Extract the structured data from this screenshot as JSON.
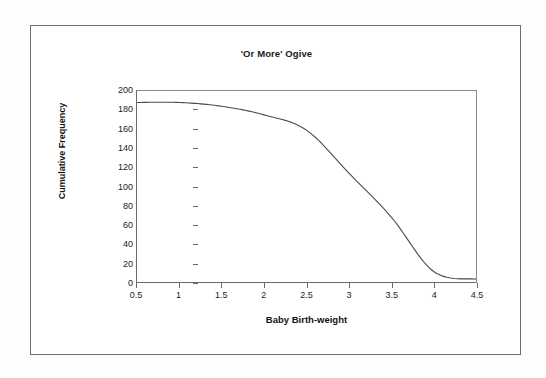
{
  "figure": {
    "title": "'Or More' Ogive"
  },
  "chart_data": {
    "type": "line",
    "title": "'Or More' Ogive",
    "xlabel": "Baby Birth-weight",
    "ylabel": "Cumulative Frequency",
    "xlim": [
      0.5,
      4.5
    ],
    "ylim": [
      0,
      200
    ],
    "grid": false,
    "legend": null,
    "x_ticks": [
      "0.5",
      "1",
      "1.5",
      "2",
      "2.5",
      "3",
      "3.5",
      "4",
      "4.5"
    ],
    "x_tick_values": [
      0.5,
      1,
      1.5,
      2,
      2.5,
      3,
      3.5,
      4,
      4.5
    ],
    "y_ticks": [
      "0",
      "20",
      "40",
      "60",
      "80",
      "100",
      "120",
      "140",
      "160",
      "180",
      "200"
    ],
    "y_tick_values": [
      0,
      20,
      40,
      60,
      80,
      100,
      120,
      140,
      160,
      180,
      200
    ],
    "series": [
      {
        "name": "'Or more' cumulative frequency",
        "color": "#4a4a4a",
        "x": [
          0.5,
          1.0,
          1.5,
          2.0,
          2.5,
          3.0,
          3.5,
          4.0,
          4.5
        ],
        "values": [
          188,
          188,
          184,
          175,
          159,
          114,
          68,
          11,
          3
        ]
      }
    ]
  }
}
